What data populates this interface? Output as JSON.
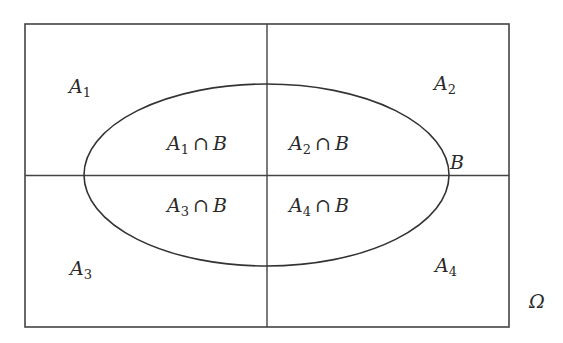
{
  "diagram": {
    "type": "venn-partition",
    "universe_label": "Ω",
    "set_label": "B",
    "colors": {
      "stroke": "#444444",
      "text": "#2a2a2a",
      "background": "#ffffff"
    },
    "partitions": [
      {
        "id": "A1",
        "base": "A",
        "sub": "1",
        "intersection_base": "A",
        "intersection_sub": "1",
        "op": "∩",
        "set": "B"
      },
      {
        "id": "A2",
        "base": "A",
        "sub": "2",
        "intersection_base": "A",
        "intersection_sub": "2",
        "op": "∩",
        "set": "B"
      },
      {
        "id": "A3",
        "base": "A",
        "sub": "3",
        "intersection_base": "A",
        "intersection_sub": "3",
        "op": "∩",
        "set": "B"
      },
      {
        "id": "A4",
        "base": "A",
        "sub": "4",
        "intersection_base": "A",
        "intersection_sub": "4",
        "op": "∩",
        "set": "B"
      }
    ]
  }
}
